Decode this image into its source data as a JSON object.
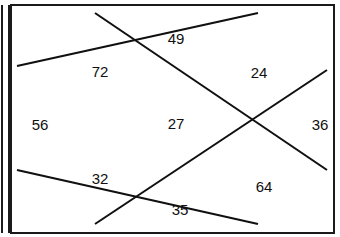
{
  "figure": {
    "canvas": {
      "width": 340,
      "height": 237
    },
    "colors": {
      "background": "#ffffff",
      "line": "#101010",
      "frame": "#1a1a1a",
      "text": "#101010"
    },
    "frame": {
      "outer_box": {
        "x": 11,
        "y": 5,
        "width": 323,
        "height": 228
      },
      "left_rule": {
        "x": 2,
        "y": 5,
        "height": 228
      }
    },
    "lines": [
      {
        "name": "line-nw-to-se-upper",
        "x1": 95,
        "y1": 13,
        "x2": 327,
        "y2": 170
      },
      {
        "name": "line-sw-to-ne-upper",
        "x1": 17,
        "y1": 66,
        "x2": 258,
        "y2": 13
      },
      {
        "name": "line-nw-to-se-lower",
        "x1": 17,
        "y1": 170,
        "x2": 258,
        "y2": 224
      },
      {
        "name": "line-sw-to-ne-lower",
        "x1": 95,
        "y1": 224,
        "x2": 327,
        "y2": 70
      }
    ],
    "labels": [
      {
        "name": "label-49",
        "text": "49",
        "x": 176,
        "y": 40
      },
      {
        "name": "label-72",
        "text": "72",
        "x": 100,
        "y": 73
      },
      {
        "name": "label-24",
        "text": "24",
        "x": 259,
        "y": 74
      },
      {
        "name": "label-56",
        "text": "56",
        "x": 40,
        "y": 126
      },
      {
        "name": "label-27",
        "text": "27",
        "x": 176,
        "y": 125
      },
      {
        "name": "label-36",
        "text": "36",
        "x": 320,
        "y": 126
      },
      {
        "name": "label-32",
        "text": "32",
        "x": 100,
        "y": 180
      },
      {
        "name": "label-64",
        "text": "64",
        "x": 264,
        "y": 188
      },
      {
        "name": "label-35",
        "text": "35",
        "x": 180,
        "y": 211
      }
    ]
  }
}
